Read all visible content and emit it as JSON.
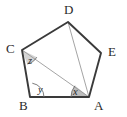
{
  "figure": {
    "kind": "geometry-diagram",
    "shape_name": "pentagon",
    "background_color": "#ffffff",
    "outline_color": "#3a3a3a",
    "diagonal_color": "#9a9a9a",
    "arc_color": "#6e6e6e",
    "shaded_angle_fill": "#b9b9b9",
    "light_shaded_angle_fill": "#d2d2d2",
    "label_color": "#2b2b2b"
  },
  "vertices": [
    {
      "name": "A",
      "label": "A",
      "x": 89,
      "y": 97,
      "label_x": 94,
      "label_y": 110
    },
    {
      "name": "B",
      "label": "B",
      "x": 30,
      "y": 97,
      "label_x": 19,
      "label_y": 110
    },
    {
      "name": "C",
      "label": "C",
      "x": 22,
      "y": 50,
      "label_x": 6,
      "label_y": 53
    },
    {
      "name": "D",
      "label": "D",
      "x": 68,
      "y": 22,
      "label_x": 64,
      "label_y": 14
    },
    {
      "name": "E",
      "label": "E",
      "x": 101,
      "y": 53,
      "label_x": 108,
      "label_y": 56
    }
  ],
  "edges": [
    {
      "name": "edge-AB",
      "from": "A",
      "to": "B"
    },
    {
      "name": "edge-BC",
      "from": "B",
      "to": "C"
    },
    {
      "name": "edge-CD",
      "from": "C",
      "to": "D"
    },
    {
      "name": "edge-DE",
      "from": "D",
      "to": "E"
    },
    {
      "name": "edge-EA",
      "from": "E",
      "to": "A"
    }
  ],
  "diagonals": [
    {
      "name": "diagonal-CA",
      "from": "C",
      "to": "A"
    },
    {
      "name": "diagonal-DA",
      "from": "D",
      "to": "A"
    }
  ],
  "angles": [
    {
      "name": "angle-x",
      "label": "x",
      "at_vertex": "A",
      "between": [
        "B",
        "C"
      ],
      "shaded": true,
      "label_x": 73,
      "label_y": 95
    },
    {
      "name": "angle-y",
      "label": "y",
      "at_vertex": "B",
      "between": [
        "A",
        "C"
      ],
      "shaded": false,
      "label_x": 38,
      "label_y": 93
    },
    {
      "name": "angle-z",
      "label": "z",
      "at_vertex": "C",
      "between": [
        "B",
        "A"
      ],
      "shaded": true,
      "label_x": 28,
      "label_y": 64
    }
  ]
}
